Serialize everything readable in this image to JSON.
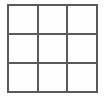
{
  "canvas": {
    "width": 105,
    "height": 99,
    "background_color": "#ffffff"
  },
  "grid": {
    "name": "3x3-grid",
    "rows": 3,
    "columns": 3,
    "line_color": "#5a5a5a",
    "line_width_px": 2,
    "cell_fill_color": "#fefefe",
    "bounds": {
      "x": 7,
      "y": 4,
      "width": 91,
      "height": 89
    },
    "cells": [
      {
        "row": 1,
        "column": 1,
        "label": ""
      },
      {
        "row": 1,
        "column": 2,
        "label": ""
      },
      {
        "row": 1,
        "column": 3,
        "label": ""
      },
      {
        "row": 2,
        "column": 1,
        "label": ""
      },
      {
        "row": 2,
        "column": 2,
        "label": ""
      },
      {
        "row": 2,
        "column": 3,
        "label": ""
      },
      {
        "row": 3,
        "column": 1,
        "label": ""
      },
      {
        "row": 3,
        "column": 2,
        "label": ""
      },
      {
        "row": 3,
        "column": 3,
        "label": ""
      }
    ]
  }
}
